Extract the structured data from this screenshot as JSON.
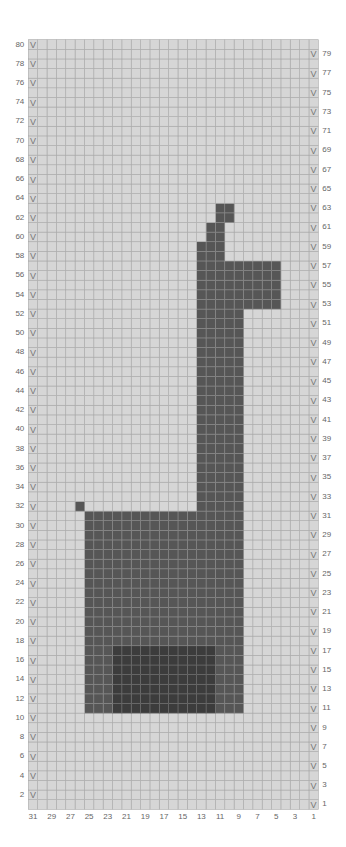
{
  "chart_data": {
    "type": "heatmap",
    "title": "",
    "columns": 31,
    "rows": 80,
    "column_numbering": "right-to-left, 1 at right edge",
    "row_numbering": "bottom-to-top, 1 at bottom",
    "left_row_labels": [
      80,
      78,
      76,
      74,
      72,
      70,
      68,
      66,
      64,
      62,
      60,
      58,
      56,
      54,
      52,
      50,
      48,
      46,
      44,
      42,
      40,
      38,
      36,
      34,
      32,
      30,
      28,
      26,
      24,
      22,
      20,
      18,
      16,
      14,
      12,
      10,
      8,
      6,
      4,
      2
    ],
    "right_row_labels": [
      79,
      77,
      75,
      73,
      71,
      69,
      67,
      65,
      63,
      61,
      59,
      57,
      55,
      53,
      51,
      49,
      47,
      45,
      43,
      41,
      39,
      37,
      35,
      33,
      31,
      29,
      27,
      25,
      23,
      21,
      19,
      17,
      15,
      13,
      11,
      9,
      7,
      5,
      3,
      1
    ],
    "bottom_col_labels": [
      31,
      29,
      27,
      25,
      23,
      21,
      19,
      17,
      15,
      13,
      11,
      9,
      7,
      5,
      3,
      1
    ],
    "row_marker_symbol": "V",
    "left_markers_on_even_rows": true,
    "right_markers_on_odd_rows": true,
    "colors": {
      "background": "#d6d6d6",
      "background_grid": "#a8a8a8",
      "main": "#565656",
      "main_grid": "#8a8a8a",
      "contrast": "#3c3c3c",
      "contrast_grid": "#6e6e6e",
      "label": "#666666"
    },
    "shapes": [
      {
        "name": "ear-top",
        "color": "main",
        "rows": [
          62,
          63
        ],
        "cols": [
          10,
          11
        ]
      },
      {
        "name": "ear-lower",
        "color": "main",
        "rows": [
          60,
          61
        ],
        "cols": [
          11,
          12
        ]
      },
      {
        "name": "head-top",
        "color": "main",
        "rows": [
          58,
          59
        ],
        "cols": [
          11,
          13
        ]
      },
      {
        "name": "head",
        "color": "main",
        "rows": [
          53,
          57
        ],
        "cols": [
          5,
          13
        ]
      },
      {
        "name": "neck",
        "color": "main",
        "rows": [
          32,
          52
        ],
        "cols": [
          9,
          13
        ]
      },
      {
        "name": "tail",
        "color": "main",
        "rows": [
          32,
          32
        ],
        "cols": [
          26,
          26
        ]
      },
      {
        "name": "body",
        "color": "main",
        "rows": [
          11,
          31
        ],
        "cols": [
          9,
          25
        ]
      },
      {
        "name": "blanket",
        "color": "contrast",
        "rows": [
          11,
          17
        ],
        "cols": [
          12,
          22
        ]
      }
    ],
    "layout": {
      "grid_left_px": 28.3,
      "grid_right_px": 318.3,
      "grid_top_px": 39.7,
      "grid_bottom_px": 809.3
    }
  }
}
